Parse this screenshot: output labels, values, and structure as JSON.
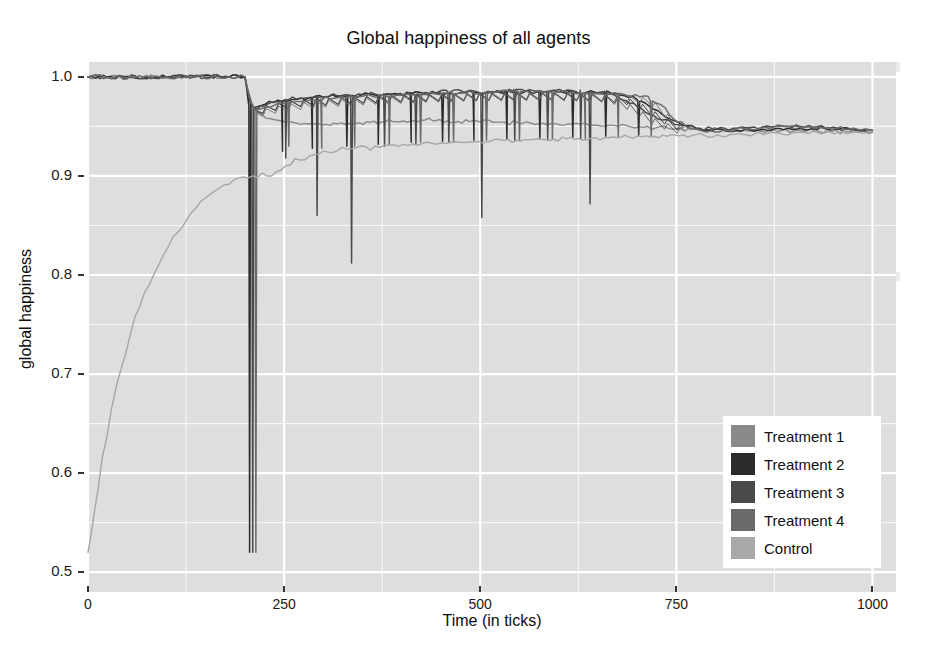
{
  "chart_data": {
    "type": "line",
    "title": "Global happiness of all agents",
    "xlabel": "Time (in ticks)",
    "ylabel": "global happiness",
    "xlim": [
      0,
      1030
    ],
    "ylim": [
      0.48,
      1.015
    ],
    "xticks": [
      0,
      250,
      500,
      750,
      1000
    ],
    "xtick_labels": [
      "0",
      "250",
      "500",
      "750",
      "1000"
    ],
    "yticks": [
      0.5,
      0.6,
      0.7,
      0.8,
      0.9,
      1.0
    ],
    "ytick_labels": [
      "0.5",
      "0.6",
      "0.7",
      "0.8",
      "0.9",
      "1.0"
    ],
    "grid": true,
    "grid_color": "#ffffff",
    "panel_background": "#e2e2e2",
    "legend_position": "bottom-right",
    "legend": [
      {
        "label": "Treatment 1",
        "color": "#8a8a8a"
      },
      {
        "label": "Treatment 2",
        "color": "#2b2b2b"
      },
      {
        "label": "Treatment 3",
        "color": "#4a4a4a"
      },
      {
        "label": "Treatment 4",
        "color": "#6a6a6a"
      },
      {
        "label": "Control",
        "color": "#a8a8a8"
      }
    ],
    "series": [
      {
        "name": "Treatment 1",
        "color": "#8a8a8a",
        "x": [
          0,
          60,
          120,
          180,
          200,
          204,
          208,
          214,
          222,
          232,
          244,
          250,
          262,
          276,
          290,
          304,
          318,
          332,
          346,
          360,
          374,
          388,
          402,
          416,
          430,
          444,
          458,
          472,
          486,
          500,
          516,
          532,
          548,
          564,
          580,
          596,
          612,
          628,
          644,
          660,
          676,
          692,
          708,
          724,
          740,
          756,
          772,
          788,
          804,
          820,
          836,
          852,
          868,
          884,
          900,
          916,
          932,
          948,
          964,
          980,
          1000
        ],
        "y": [
          1.0,
          1.0,
          1.0,
          1.0,
          1.0,
          0.985,
          0.972,
          0.966,
          0.962,
          0.958,
          0.956,
          0.955,
          0.954,
          0.953,
          0.9525,
          0.952,
          0.9525,
          0.953,
          0.9535,
          0.954,
          0.9545,
          0.955,
          0.9555,
          0.956,
          0.9565,
          0.956,
          0.9555,
          0.955,
          0.9548,
          0.9545,
          0.9542,
          0.954,
          0.9538,
          0.9535,
          0.9532,
          0.9528,
          0.9525,
          0.952,
          0.9512,
          0.9505,
          0.95,
          0.9495,
          0.949,
          0.9485,
          0.948,
          0.9476,
          0.9472,
          0.947,
          0.9468,
          0.9466,
          0.9464,
          0.9462,
          0.946,
          0.9458,
          0.9456,
          0.9453,
          0.945,
          0.9447,
          0.9444,
          0.9441,
          0.944
        ]
      },
      {
        "name": "Treatment 2",
        "color": "#2b2b2b",
        "x": [
          0,
          100,
          180,
          200,
          202,
          205,
          208,
          212,
          218,
          226,
          236,
          248,
          260,
          272,
          286,
          300,
          316,
          332,
          348,
          364,
          380,
          396,
          412,
          428,
          444,
          460,
          476,
          492,
          508,
          524,
          540,
          556,
          572,
          588,
          604,
          620,
          636,
          652,
          668,
          684,
          700,
          716,
          732,
          748,
          764,
          780,
          796,
          812,
          828,
          844,
          860,
          876,
          892,
          908,
          924,
          940,
          956,
          972,
          988,
          1000
        ],
        "y": [
          1.0,
          1.0,
          1.0,
          1.0,
          0.99,
          0.978,
          0.972,
          0.969,
          0.9705,
          0.9725,
          0.974,
          0.9755,
          0.977,
          0.9785,
          0.979,
          0.9795,
          0.9802,
          0.981,
          0.9815,
          0.982,
          0.9825,
          0.9828,
          0.983,
          0.9832,
          0.9835,
          0.9838,
          0.984,
          0.9842,
          0.9843,
          0.9844,
          0.9845,
          0.9846,
          0.9847,
          0.9848,
          0.9848,
          0.9847,
          0.9845,
          0.984,
          0.983,
          0.981,
          0.977,
          0.97,
          0.962,
          0.9555,
          0.951,
          0.948,
          0.946,
          0.9455,
          0.9458,
          0.9465,
          0.9472,
          0.9478,
          0.948,
          0.948,
          0.9478,
          0.9475,
          0.947,
          0.9465,
          0.946,
          0.9455
        ],
        "spikes": [
          {
            "x": 206,
            "depth": 0.52
          },
          {
            "x": 248,
            "depth": 0.925
          },
          {
            "x": 286,
            "depth": 0.928
          },
          {
            "x": 330,
            "depth": 0.93
          },
          {
            "x": 370,
            "depth": 0.932
          },
          {
            "x": 412,
            "depth": 0.934
          },
          {
            "x": 452,
            "depth": 0.935
          },
          {
            "x": 492,
            "depth": 0.936
          },
          {
            "x": 534,
            "depth": 0.937
          },
          {
            "x": 576,
            "depth": 0.938
          },
          {
            "x": 618,
            "depth": 0.939
          },
          {
            "x": 660,
            "depth": 0.94
          },
          {
            "x": 702,
            "depth": 0.941
          }
        ]
      },
      {
        "name": "Treatment 3",
        "color": "#4a4a4a",
        "x": [
          0,
          100,
          180,
          200,
          203,
          207,
          212,
          220,
          230,
          242,
          256,
          270,
          286,
          302,
          318,
          334,
          350,
          366,
          382,
          398,
          414,
          430,
          446,
          462,
          478,
          494,
          510,
          526,
          542,
          558,
          574,
          590,
          606,
          622,
          638,
          650,
          662,
          674,
          686,
          700,
          716,
          732,
          748,
          764,
          780,
          796,
          812,
          828,
          844,
          860,
          876,
          892,
          908,
          924,
          940,
          956,
          972,
          988,
          1000
        ],
        "y": [
          1.0,
          1.0,
          1.0,
          1.0,
          0.988,
          0.975,
          0.968,
          0.9705,
          0.973,
          0.9752,
          0.977,
          0.9785,
          0.9795,
          0.98,
          0.9808,
          0.9815,
          0.982,
          0.9825,
          0.983,
          0.9834,
          0.9838,
          0.9842,
          0.9845,
          0.9848,
          0.985,
          0.9852,
          0.9854,
          0.9856,
          0.9857,
          0.9858,
          0.9858,
          0.9857,
          0.9854,
          0.985,
          0.9845,
          0.984,
          0.9826,
          0.98,
          0.976,
          0.97,
          0.962,
          0.9565,
          0.952,
          0.9495,
          0.948,
          0.9475,
          0.9478,
          0.9485,
          0.949,
          0.9495,
          0.95,
          0.9502,
          0.9498,
          0.9492,
          0.9486,
          0.948,
          0.9474,
          0.9468,
          0.9465
        ],
        "spikes": [
          {
            "x": 210,
            "depth": 0.52
          },
          {
            "x": 252,
            "depth": 0.918
          },
          {
            "x": 292,
            "depth": 0.86
          },
          {
            "x": 336,
            "depth": 0.812
          },
          {
            "x": 378,
            "depth": 0.93
          },
          {
            "x": 418,
            "depth": 0.932
          },
          {
            "x": 460,
            "depth": 0.934
          },
          {
            "x": 502,
            "depth": 0.858
          },
          {
            "x": 544,
            "depth": 0.935
          },
          {
            "x": 586,
            "depth": 0.936
          },
          {
            "x": 628,
            "depth": 0.937
          },
          {
            "x": 640,
            "depth": 0.872
          }
        ]
      },
      {
        "name": "Treatment 4",
        "color": "#6a6a6a",
        "x": [
          0,
          100,
          180,
          200,
          204,
          209,
          216,
          226,
          238,
          252,
          266,
          282,
          298,
          314,
          330,
          346,
          362,
          378,
          394,
          410,
          426,
          442,
          458,
          474,
          490,
          506,
          522,
          538,
          554,
          570,
          586,
          602,
          618,
          634,
          650,
          666,
          682,
          698,
          714,
          730,
          746,
          762,
          778,
          794,
          810,
          826,
          842,
          858,
          874,
          890,
          906,
          922,
          938,
          954,
          970,
          986,
          1000
        ],
        "y": [
          1.0,
          1.0,
          1.0,
          1.0,
          0.986,
          0.973,
          0.967,
          0.9695,
          0.9715,
          0.9735,
          0.975,
          0.9765,
          0.9775,
          0.9785,
          0.979,
          0.9798,
          0.9805,
          0.981,
          0.9815,
          0.982,
          0.9825,
          0.983,
          0.9834,
          0.9838,
          0.984,
          0.9842,
          0.9845,
          0.9848,
          0.985,
          0.985,
          0.9848,
          0.9845,
          0.984,
          0.9835,
          0.983,
          0.9828,
          0.9824,
          0.982,
          0.9805,
          0.972,
          0.958,
          0.9505,
          0.9465,
          0.9455,
          0.946,
          0.947,
          0.948,
          0.9488,
          0.9492,
          0.9495,
          0.9494,
          0.949,
          0.9484,
          0.9478,
          0.947,
          0.9462,
          0.9458
        ],
        "spikes": [
          {
            "x": 214,
            "depth": 0.52
          },
          {
            "x": 256,
            "depth": 0.93
          },
          {
            "x": 298,
            "depth": 0.928
          },
          {
            "x": 340,
            "depth": 0.93
          },
          {
            "x": 384,
            "depth": 0.932
          },
          {
            "x": 424,
            "depth": 0.934
          },
          {
            "x": 466,
            "depth": 0.934
          },
          {
            "x": 508,
            "depth": 0.936
          },
          {
            "x": 550,
            "depth": 0.936
          },
          {
            "x": 592,
            "depth": 0.937
          },
          {
            "x": 634,
            "depth": 0.938
          },
          {
            "x": 676,
            "depth": 0.939
          },
          {
            "x": 718,
            "depth": 0.94
          }
        ]
      },
      {
        "name": "Control",
        "color": "#a8a8a8",
        "x": [
          0,
          8,
          18,
          30,
          42,
          54,
          66,
          78,
          90,
          102,
          114,
          126,
          138,
          150,
          162,
          174,
          186,
          198,
          210,
          222,
          234,
          246,
          258,
          270,
          282,
          294,
          306,
          318,
          330,
          342,
          354,
          366,
          378,
          390,
          402,
          414,
          426,
          438,
          450,
          462,
          474,
          486,
          498,
          514,
          530,
          546,
          562,
          578,
          594,
          610,
          626,
          642,
          658,
          674,
          690,
          706,
          722,
          738,
          754,
          770,
          786,
          802,
          818,
          834,
          850,
          866,
          882,
          898,
          914,
          930,
          946,
          962,
          978,
          994,
          1000
        ],
        "y": [
          0.52,
          0.56,
          0.615,
          0.665,
          0.705,
          0.74,
          0.768,
          0.79,
          0.81,
          0.828,
          0.843,
          0.856,
          0.868,
          0.878,
          0.885,
          0.891,
          0.896,
          0.899,
          0.9,
          0.903,
          0.9,
          0.906,
          0.911,
          0.916,
          0.92,
          0.922,
          0.924,
          0.9255,
          0.927,
          0.9285,
          0.9295,
          0.9302,
          0.9308,
          0.9312,
          0.9318,
          0.9322,
          0.9326,
          0.933,
          0.9334,
          0.9338,
          0.934,
          0.9344,
          0.9348,
          0.9352,
          0.9356,
          0.936,
          0.9364,
          0.9368,
          0.937,
          0.9374,
          0.9378,
          0.938,
          0.9384,
          0.9388,
          0.939,
          0.9394,
          0.9398,
          0.94,
          0.9404,
          0.9408,
          0.941,
          0.9414,
          0.9418,
          0.942,
          0.9424,
          0.9428,
          0.943,
          0.9434,
          0.9438,
          0.944,
          0.9442,
          0.9444,
          0.9446,
          0.9448,
          0.945
        ]
      }
    ]
  }
}
